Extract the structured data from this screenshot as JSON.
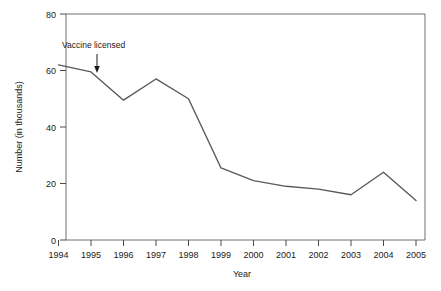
{
  "chart_data": {
    "type": "line",
    "title": "",
    "subtitle": "",
    "xlabel": "Year",
    "ylabel": "Number (in thousands)",
    "xlim": [
      1994,
      2005
    ],
    "ylim": [
      0,
      80
    ],
    "grid": false,
    "legend": "none",
    "x": [
      1994,
      1995,
      1996,
      1997,
      1998,
      1999,
      2000,
      2001,
      2002,
      2003,
      2004,
      2005
    ],
    "xtick_labels": [
      "1994",
      "1995",
      "1996",
      "1997",
      "1998",
      "1999",
      "2000",
      "2001",
      "2002",
      "2003",
      "2004",
      "2005"
    ],
    "ytick_values": [
      0,
      20,
      40,
      60,
      80
    ],
    "ytick_labels": [
      "0",
      "20",
      "40",
      "60",
      "80"
    ],
    "series": [
      {
        "name": "Number (in thousands)",
        "color": "#5a5a5a",
        "values": [
          62,
          59.5,
          49.5,
          57,
          50,
          25.5,
          21,
          19,
          18,
          16,
          24,
          14
        ]
      }
    ],
    "annotations": [
      {
        "label": "Vaccine licensed",
        "points_to_x": 1995,
        "points_to_y": 59.5,
        "arrow": "down"
      }
    ]
  }
}
